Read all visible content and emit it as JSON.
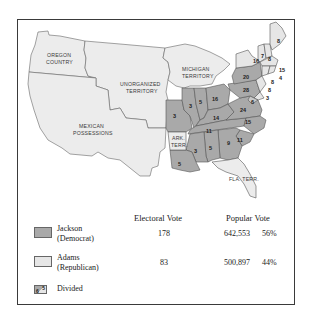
{
  "map": {
    "territory_labels": [
      {
        "id": "oregon",
        "lines": [
          "OREGON",
          "COUNTRY"
        ]
      },
      {
        "id": "unorganized",
        "lines": [
          "UNORGANIZED",
          "TERRITORY"
        ]
      },
      {
        "id": "mexican",
        "lines": [
          "MEXICAN",
          "POSSESSIONS"
        ]
      },
      {
        "id": "michigan",
        "lines": [
          "MICHIGAN",
          "TERRITORY"
        ]
      },
      {
        "id": "arkansas",
        "lines": [
          "ARK.",
          "TERR."
        ]
      },
      {
        "id": "florida",
        "lines": [
          "FLA. TERR."
        ]
      }
    ],
    "state_electoral_votes": {
      "missouri": "3",
      "illinois": "3",
      "indiana": "5",
      "ohio": "16",
      "kentucky": "14",
      "tennessee": "11",
      "virginia": "24",
      "north_carolina": "15",
      "south_carolina": "11",
      "georgia": "9",
      "alabama": "5",
      "mississippi": "3",
      "louisiana": "5",
      "pennsylvania": "28",
      "new_york": "20",
      "new_york_adams": "16",
      "vermont": "7",
      "new_hampshire": "8",
      "maine": "8",
      "maine_split": "1",
      "massachusetts": "15",
      "rhode_island": "4",
      "connecticut": "8",
      "new_jersey": "8",
      "delaware": "3",
      "maryland": "6",
      "maryland_split": "5"
    },
    "colors": {
      "jackson": "#a9a9a9",
      "adams": "#e6e6e6",
      "territory": "#ececec",
      "border": "#555555"
    }
  },
  "legend": {
    "headers": {
      "electoral": "Electoral Vote",
      "popular": "Popular Vote"
    },
    "rows": [
      {
        "name_line1": "Jackson",
        "name_line2": "(Democrat)",
        "electoral": "178",
        "popular": "642,553",
        "percent": "56%"
      },
      {
        "name_line1": "Adams",
        "name_line2": "(Republican)",
        "electoral": "83",
        "popular": "500,897",
        "percent": "44%"
      }
    ],
    "divided": {
      "label": "Divided",
      "sample_left": "6",
      "sample_right": "5"
    }
  }
}
